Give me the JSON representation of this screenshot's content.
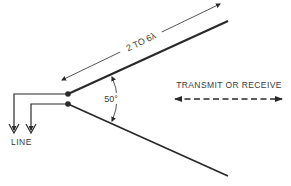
{
  "diagram": {
    "type": "V-antenna",
    "labels": {
      "length": "2 TO 6λ",
      "angle": "50°",
      "direction": "TRANSMIT OR RECEIVE",
      "feed": "LINE"
    },
    "colors": {
      "line": "#2a2a2a",
      "text": "#3a3a3a",
      "background": "#ffffff"
    }
  }
}
